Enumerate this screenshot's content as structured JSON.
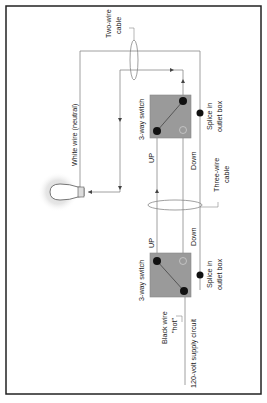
{
  "diagram": {
    "labels": {
      "two_wire_cable_1": "Two-wire",
      "two_wire_cable_2": "cable",
      "white_wire": "White wire (neutral)",
      "switch_top": "3-way switch",
      "switch_bottom": "3-way switch",
      "up_top": "UP",
      "down_top": "Down",
      "up_bottom": "UP",
      "down_bottom": "Down",
      "splice_top_1": "Splice in",
      "splice_top_2": "outlet box",
      "splice_bottom_1": "Splice in",
      "splice_bottom_2": "outlet box",
      "three_wire_1": "Three-wire",
      "three_wire_2": "cable",
      "black_wire_1": "Black wire",
      "black_wire_2": "\"hot\"",
      "supply": "120-volt supply circuit"
    },
    "colors": {
      "switch_box": "#9a9a9a",
      "wire": "#666666",
      "terminal": "#111111",
      "border": "#222222"
    }
  }
}
